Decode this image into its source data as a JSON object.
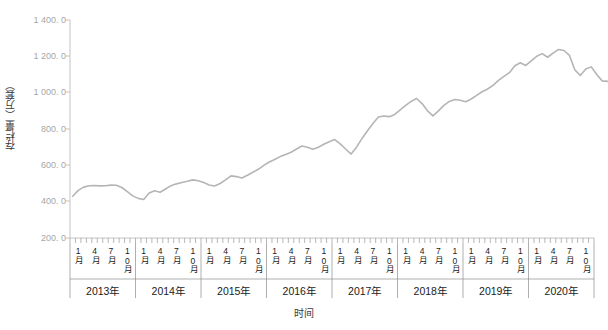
{
  "chart_data": {
    "type": "line",
    "title": "",
    "xlabel": "时间",
    "ylabel": "存栏量（万套）",
    "ylim": [
      200,
      1400
    ],
    "yticks": [
      200,
      400,
      600,
      800,
      1000,
      1200,
      1400
    ],
    "ytick_labels": [
      "200. 0",
      "400. 0",
      "600. 0",
      "800. 0",
      "1 000. 0",
      "1 200. 0",
      "1 400. 0"
    ],
    "grid": false,
    "legend": null,
    "line_color": "#b5b5b5",
    "axis_color": "#bfbfbf",
    "month_tick_labels": [
      "1月",
      "4月",
      "7月",
      "10月"
    ],
    "year_groups": [
      "2013年",
      "2014年",
      "2015年",
      "2016年",
      "2017年",
      "2018年",
      "2019年",
      "2020年"
    ],
    "x_unit": "month",
    "x_start": "2013-01",
    "x_end": "2020-12",
    "series": [
      {
        "name": "存栏量",
        "values": [
          430,
          462,
          480,
          488,
          489,
          487,
          488,
          491,
          490,
          478,
          455,
          432,
          418,
          412,
          448,
          460,
          452,
          470,
          488,
          498,
          505,
          512,
          520,
          515,
          505,
          492,
          486,
          500,
          520,
          542,
          538,
          530,
          545,
          562,
          578,
          600,
          618,
          632,
          648,
          660,
          672,
          690,
          706,
          700,
          688,
          700,
          716,
          730,
          742,
          718,
          690,
          662,
          700,
          748,
          790,
          830,
          866,
          872,
          868,
          880,
          905,
          930,
          952,
          968,
          940,
          900,
          872,
          900,
          930,
          952,
          962,
          958,
          950,
          965,
          985,
          1005,
          1020,
          1040,
          1068,
          1090,
          1110,
          1148,
          1165,
          1150,
          1175,
          1200,
          1215,
          1195,
          1218,
          1238,
          1232,
          1205,
          1125,
          1095,
          1130,
          1142,
          1100,
          1065,
          1062
        ]
      }
    ]
  }
}
